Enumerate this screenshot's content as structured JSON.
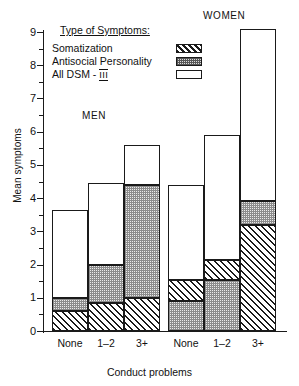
{
  "chart_data": {
    "type": "bar",
    "subtype": "stacked-bar",
    "title": "",
    "xlabel": "Conduct problems",
    "ylabel": "Mean symptoms",
    "ylim": [
      0,
      9.5
    ],
    "yticks": [
      0,
      1,
      2,
      3,
      4,
      5,
      6,
      7,
      8,
      9
    ],
    "ytick_labels": [
      "0",
      "1",
      "2",
      "3",
      "4",
      "5",
      "6",
      "7",
      "8",
      "9"
    ],
    "minor_ticks": [
      0.5,
      1.5,
      2.5,
      3.5,
      4.5,
      5.5,
      6.5,
      7.5,
      8.5
    ],
    "grid": false,
    "legend_position": "upper-left-inside",
    "categories": [
      "None",
      "1–2",
      "3+"
    ],
    "groups": [
      "MEN",
      "WOMEN"
    ],
    "series": [
      {
        "name": "Somatization",
        "pattern": "diagonal-hatch"
      },
      {
        "name": "Antisocial Personality",
        "pattern": "stipple"
      },
      {
        "name": "All DSM - III",
        "pattern": "empty"
      }
    ],
    "bars": [
      {
        "group": "MEN",
        "category": "None",
        "cumulative_tops": {
          "Somatization": 0.6,
          "Antisocial Personality": 1.0,
          "All DSM - III": 3.65
        },
        "stack_order": [
          "Somatization",
          "Antisocial Personality",
          "All DSM - III"
        ],
        "total": 3.65
      },
      {
        "group": "MEN",
        "category": "1–2",
        "cumulative_tops": {
          "Somatization": 0.85,
          "Antisocial Personality": 2.0,
          "All DSM - III": 4.45
        },
        "stack_order": [
          "Somatization",
          "Antisocial Personality",
          "All DSM - III"
        ],
        "total": 4.45
      },
      {
        "group": "MEN",
        "category": "3+",
        "cumulative_tops": {
          "Somatization": 1.0,
          "Antisocial Personality": 4.4,
          "All DSM - III": 5.6
        },
        "stack_order": [
          "Somatization",
          "Antisocial Personality",
          "All DSM - III"
        ],
        "total": 5.6
      },
      {
        "group": "WOMEN",
        "category": "None",
        "cumulative_tops": {
          "Antisocial Personality": 0.9,
          "Somatization": 1.55,
          "All DSM - III": 4.4
        },
        "stack_order": [
          "Antisocial Personality",
          "Somatization",
          "All DSM - III"
        ],
        "total": 4.4
      },
      {
        "group": "WOMEN",
        "category": "1–2",
        "cumulative_tops": {
          "Antisocial Personality": 1.55,
          "Somatization": 2.15,
          "All DSM - III": 5.9
        },
        "stack_order": [
          "Antisocial Personality",
          "Somatization",
          "All DSM - III"
        ],
        "total": 5.9
      },
      {
        "group": "WOMEN",
        "category": "3+",
        "cumulative_tops": {
          "Somatization": 3.2,
          "Antisocial Personality": 3.9,
          "All DSM - III": 9.1
        },
        "stack_order": [
          "Somatization",
          "Antisocial Personality",
          "All DSM - III"
        ],
        "total": 9.1
      }
    ]
  },
  "legend": {
    "title": "Type of Symptoms:",
    "items": [
      {
        "label": "Somatization",
        "swatch": "diagonal-hatch-swatch"
      },
      {
        "label": "Antisocial Personality",
        "swatch": "stipple-swatch"
      },
      {
        "label": "All DSM - ",
        "roman": "III",
        "swatch": "empty-swatch"
      }
    ]
  },
  "group_labels": {
    "men": "MEN",
    "women": "WOMEN"
  },
  "axis": {
    "y_title": "Mean symptoms",
    "x_title": "Conduct problems",
    "y_ticks": [
      "9",
      "8",
      "7",
      "6",
      "5",
      "4",
      "3",
      "2",
      "1",
      "0"
    ]
  },
  "x_categories": [
    "None",
    "1–2",
    "3+",
    "None",
    "1–2",
    "3+"
  ],
  "colors": {
    "ink": "#1a1a1a",
    "background": "#ffffff",
    "stipple": "#ebebeb"
  }
}
